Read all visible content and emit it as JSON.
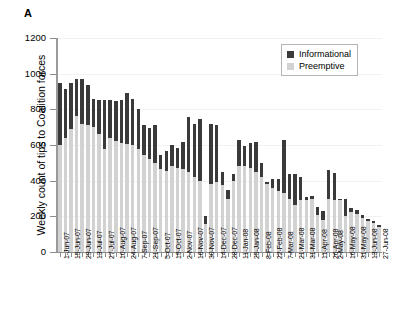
{
  "figure": {
    "panel_label": "A"
  },
  "chart_data": {
    "type": "bar",
    "subtype": "stacked",
    "title": "",
    "xlabel": "",
    "ylabel": "Weekly count of tips to Coalition forces",
    "ylim": [
      0,
      1200
    ],
    "yticks": [
      0,
      200,
      400,
      600,
      800,
      1000,
      1200
    ],
    "ytick_labels": [
      "0",
      "200",
      "400",
      "600",
      "800",
      "1000",
      "1200"
    ],
    "grid": true,
    "legend_position": "top-right",
    "legend": [
      {
        "name": "Informational",
        "color": "#3a3a3a"
      },
      {
        "name": "Preemptive",
        "color": "#d2d2d2"
      }
    ],
    "categories": [
      "1-Jun-07",
      "8-Jun-07",
      "15-Jun-07",
      "22-Jun-07",
      "29-Jun-07",
      "6-Jul-07",
      "13-Jul-07",
      "20-Jul-07",
      "27-Jul-07",
      "3-Aug-07",
      "10-Aug-07",
      "17-Aug-07",
      "24-Aug-07",
      "31-Aug-07",
      "7-Sep-07",
      "14-Sep-07",
      "21-Sep-07",
      "28-Sep-07",
      "5-Oct-07",
      "12-Oct-07",
      "19-Oct-07",
      "26-Oct-07",
      "2-Nov-07",
      "9-Nov-07",
      "16-Nov-07",
      "23-Nov-07",
      "30-Nov-07",
      "7-Dec-07",
      "14-Dec-07",
      "21-Dec-07",
      "28-Dec-07",
      "4-Jan-08",
      "11-Jan-08",
      "18-Jan-08",
      "25-Jan-08",
      "1-Feb-08",
      "8-Feb-08",
      "15-Feb-08",
      "22-Feb-08",
      "29-Feb-08",
      "7-Mar-08",
      "14-Mar-08",
      "21-Mar-08",
      "28-Mar-08",
      "31-Mar-08",
      "4-Apr-08",
      "11-Apr-08",
      "18-Apr-08",
      "26-Apr-08",
      "2-May-08",
      "9-May-08",
      "16-May-08",
      "23-May-08",
      "31-May-08",
      "6-Jun-08",
      "13-Jun-08",
      "20-Jun-08",
      "27-Jun-08"
    ],
    "xtick_labels": [
      "1-Jun-07",
      "15-Jun-07",
      "29-Jun-07",
      "13-Jul-07",
      "27-Jul-07",
      "10-Aug-07",
      "24-Aug-07",
      "7-Sep-07",
      "21-Sep-07",
      "5-Oct-07",
      "19-Oct-07",
      "2-Nov-07",
      "16-Nov-07",
      "30-Nov-07",
      "14-Dec-07",
      "28-Dec-07",
      "11-Jan-08",
      "25-Jan-08",
      "8-Feb-08",
      "22-Feb-08",
      "7-Mar-08",
      "21-Mar-08",
      "31-Mar-08",
      "11-Apr-08",
      "26-Apr-08",
      "2-May-08",
      "16-May-08",
      "31-May-08",
      "13-Jun-08",
      "27-Jun-08"
    ],
    "xtick_indices": [
      0,
      2,
      4,
      6,
      8,
      10,
      12,
      14,
      16,
      18,
      20,
      22,
      24,
      26,
      28,
      30,
      32,
      34,
      36,
      38,
      40,
      42,
      44,
      46,
      48,
      49,
      51,
      53,
      55,
      57
    ],
    "series": [
      {
        "name": "Preemptive",
        "color": "#d2d2d2",
        "values": [
          600,
          640,
          690,
          760,
          720,
          710,
          700,
          660,
          580,
          640,
          620,
          610,
          605,
          600,
          575,
          545,
          520,
          500,
          465,
          455,
          480,
          470,
          465,
          450,
          420,
          400,
          155,
          380,
          390,
          375,
          300,
          400,
          480,
          480,
          470,
          450,
          420,
          380,
          360,
          340,
          330,
          300,
          265,
          290,
          290,
          300,
          210,
          180,
          300,
          290,
          290,
          200,
          225,
          215,
          190,
          175,
          160,
          140
        ]
      },
      {
        "name": "Informational",
        "color": "#3a3a3a",
        "values": [
          350,
          275,
          260,
          210,
          250,
          225,
          160,
          195,
          275,
          210,
          225,
          245,
          285,
          260,
          225,
          170,
          175,
          215,
          80,
          110,
          120,
          115,
          150,
          305,
          300,
          345,
          45,
          340,
          320,
          75,
          45,
          40,
          150,
          115,
          140,
          165,
          80,
          15,
          50,
          70,
          300,
          135,
          175,
          130,
          20,
          15,
          40,
          50,
          160,
          155,
          10,
          95,
          20,
          20,
          15,
          10,
          15,
          10
        ]
      }
    ]
  }
}
